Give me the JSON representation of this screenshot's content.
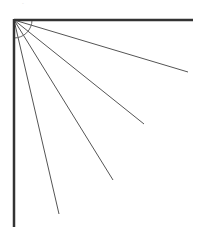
{
  "diagram": {
    "type": "angle-fan",
    "origin": [
      14,
      20
    ],
    "axes": {
      "horizontal_end": [
        193,
        20
      ],
      "vertical_end": [
        14,
        227
      ],
      "stroke": "#333333",
      "width": 2.5
    },
    "rays": [
      {
        "end": [
          188,
          72
        ]
      },
      {
        "end": [
          144,
          124
        ]
      },
      {
        "end": [
          113,
          180
        ]
      },
      {
        "end": [
          59,
          214
        ]
      }
    ],
    "ray_stroke": "#555555",
    "arc": {
      "radius": 18,
      "stroke": "#666666"
    },
    "top_mark": "-"
  }
}
